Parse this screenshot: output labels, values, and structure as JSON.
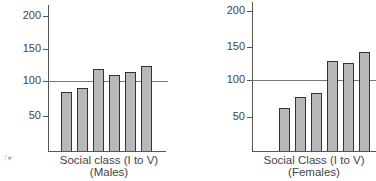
{
  "chart_data": [
    {
      "type": "bar",
      "title": "",
      "xlabel": "Social class (I to V)",
      "subtitle": "(Males)",
      "ylabel": "",
      "categories": [
        "I",
        "II",
        "IIIN",
        "IIIM",
        "IV",
        "V"
      ],
      "values": [
        83,
        89,
        119,
        109,
        114,
        123
      ],
      "yticks": [
        50,
        100,
        150,
        200
      ],
      "ylim": [
        0,
        210
      ],
      "reference_line": 100,
      "grid": false
    },
    {
      "type": "bar",
      "title": "",
      "xlabel": "Social Class (I to V)",
      "subtitle": "(Females)",
      "ylabel": "",
      "categories": [
        "I",
        "II",
        "IIIN",
        "IIIM",
        "IV",
        "V"
      ],
      "values": [
        57,
        74,
        81,
        129,
        126,
        143
      ],
      "yticks": [
        50,
        100,
        150,
        200
      ],
      "ylim": [
        0,
        210
      ],
      "reference_line": 100,
      "grid": false
    }
  ],
  "labels": {
    "males": {
      "xlabel": "Social class (I to V)",
      "sub": "(Males)",
      "ticks": [
        "200",
        "150",
        "100",
        "50"
      ]
    },
    "females": {
      "xlabel": "Social Class (I to V)",
      "sub": "(Females)",
      "ticks": [
        "200",
        "150",
        "100",
        "50"
      ]
    }
  },
  "icons": {
    "pointer": "☞"
  }
}
